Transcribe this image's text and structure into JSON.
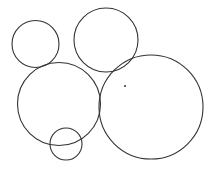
{
  "diagram": {
    "type": "circles",
    "width": 214,
    "height": 173,
    "background": "#ffffff",
    "stroke_color": "#333333",
    "circles": [
      {
        "name": "circle-top-left",
        "cx": 35.5,
        "cy": 44,
        "r": 23.5
      },
      {
        "name": "circle-top-middle",
        "cx": 106,
        "cy": 40,
        "r": 32
      },
      {
        "name": "circle-middle-left",
        "cx": 59,
        "cy": 104,
        "r": 41.5
      },
      {
        "name": "circle-bottom-small",
        "cx": 66,
        "cy": 144,
        "r": 16
      },
      {
        "name": "circle-large-right",
        "cx": 151,
        "cy": 107,
        "r": 52
      }
    ],
    "points": [
      {
        "name": "center-dot",
        "cx": 125,
        "cy": 86,
        "r": 1
      }
    ]
  }
}
